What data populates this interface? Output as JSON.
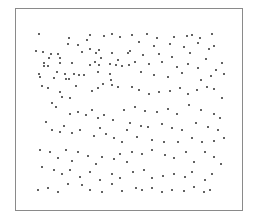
{
  "chart_data": {
    "type": "scatter",
    "title": "",
    "title_visible_fragment": "clipped title text (unreadable, only bottom pixels visible)",
    "xlabel": "",
    "ylabel": "",
    "grid": false,
    "legend": null,
    "axes_ticks_visible": false,
    "frame": {
      "left": 15,
      "top": 8,
      "right": 243,
      "bottom": 211,
      "color": "#8a8a8a"
    },
    "point_color": "#444444",
    "points": [
      [
        37,
        32
      ],
      [
        67,
        36
      ],
      [
        85,
        38
      ],
      [
        88,
        33
      ],
      [
        102,
        34
      ],
      [
        110,
        32
      ],
      [
        118,
        35
      ],
      [
        66,
        42
      ],
      [
        76,
        43
      ],
      [
        88,
        47
      ],
      [
        34,
        49
      ],
      [
        41,
        50
      ],
      [
        49,
        52
      ],
      [
        56,
        52
      ],
      [
        80,
        50
      ],
      [
        94,
        51
      ],
      [
        97,
        48
      ],
      [
        110,
        51
      ],
      [
        126,
        51
      ],
      [
        47,
        56
      ],
      [
        58,
        56
      ],
      [
        99,
        56
      ],
      [
        116,
        58
      ],
      [
        42,
        61
      ],
      [
        58,
        61
      ],
      [
        70,
        61
      ],
      [
        88,
        63
      ],
      [
        93,
        60
      ],
      [
        97,
        63
      ],
      [
        108,
        62
      ],
      [
        114,
        63
      ],
      [
        120,
        64
      ],
      [
        127,
        63
      ],
      [
        42,
        64
      ],
      [
        46,
        64
      ],
      [
        37,
        72
      ],
      [
        55,
        70
      ],
      [
        63,
        72
      ],
      [
        72,
        72
      ],
      [
        77,
        73
      ],
      [
        82,
        73
      ],
      [
        96,
        70
      ],
      [
        108,
        72
      ],
      [
        38,
        75
      ],
      [
        52,
        76
      ],
      [
        64,
        77
      ],
      [
        67,
        77
      ],
      [
        109,
        78
      ],
      [
        130,
        33
      ],
      [
        145,
        32
      ],
      [
        155,
        36
      ],
      [
        172,
        35
      ],
      [
        185,
        34
      ],
      [
        190,
        33
      ],
      [
        198,
        36
      ],
      [
        210,
        32
      ],
      [
        137,
        40
      ],
      [
        152,
        44
      ],
      [
        168,
        42
      ],
      [
        182,
        45
      ],
      [
        196,
        41
      ],
      [
        207,
        47
      ],
      [
        212,
        44
      ],
      [
        128,
        49
      ],
      [
        141,
        53
      ],
      [
        157,
        52
      ],
      [
        170,
        55
      ],
      [
        188,
        51
      ],
      [
        204,
        57
      ],
      [
        133,
        60
      ],
      [
        147,
        62
      ],
      [
        160,
        60
      ],
      [
        175,
        65
      ],
      [
        186,
        62
      ],
      [
        196,
        66
      ],
      [
        214,
        68
      ],
      [
        220,
        61
      ],
      [
        139,
        70
      ],
      [
        152,
        73
      ],
      [
        166,
        75
      ],
      [
        180,
        71
      ],
      [
        199,
        78
      ],
      [
        209,
        74
      ],
      [
        222,
        72
      ],
      [
        40,
        84
      ],
      [
        46,
        86
      ],
      [
        58,
        90
      ],
      [
        60,
        95
      ],
      [
        68,
        96
      ],
      [
        74,
        84
      ],
      [
        90,
        89
      ],
      [
        96,
        86
      ],
      [
        101,
        82
      ],
      [
        110,
        83
      ],
      [
        116,
        85
      ],
      [
        50,
        101
      ],
      [
        54,
        105
      ],
      [
        68,
        112
      ],
      [
        76,
        110
      ],
      [
        84,
        113
      ],
      [
        90,
        108
      ],
      [
        96,
        116
      ],
      [
        102,
        113
      ],
      [
        111,
        118
      ],
      [
        122,
        108
      ],
      [
        44,
        120
      ],
      [
        50,
        128
      ],
      [
        58,
        130
      ],
      [
        62,
        124
      ],
      [
        70,
        131
      ],
      [
        78,
        128
      ],
      [
        92,
        134
      ],
      [
        98,
        126
      ],
      [
        104,
        132
      ],
      [
        112,
        136
      ],
      [
        120,
        140
      ],
      [
        125,
        128
      ],
      [
        130,
        85
      ],
      [
        137,
        88
      ],
      [
        147,
        92
      ],
      [
        157,
        90
      ],
      [
        168,
        89
      ],
      [
        178,
        86
      ],
      [
        186,
        92
      ],
      [
        195,
        88
      ],
      [
        205,
        85
      ],
      [
        212,
        87
      ],
      [
        220,
        96
      ],
      [
        133,
        105
      ],
      [
        143,
        109
      ],
      [
        155,
        110
      ],
      [
        166,
        107
      ],
      [
        175,
        112
      ],
      [
        187,
        103
      ],
      [
        199,
        108
      ],
      [
        212,
        112
      ],
      [
        218,
        116
      ],
      [
        128,
        121
      ],
      [
        139,
        124
      ],
      [
        146,
        125
      ],
      [
        160,
        122
      ],
      [
        170,
        126
      ],
      [
        180,
        128
      ],
      [
        194,
        121
      ],
      [
        206,
        125
      ],
      [
        216,
        128
      ],
      [
        135,
        135
      ],
      [
        150,
        138
      ],
      [
        162,
        140
      ],
      [
        176,
        140
      ],
      [
        190,
        136
      ],
      [
        200,
        140
      ],
      [
        212,
        139
      ],
      [
        222,
        136
      ],
      [
        38,
        148
      ],
      [
        48,
        150
      ],
      [
        56,
        156
      ],
      [
        64,
        148
      ],
      [
        70,
        159
      ],
      [
        76,
        150
      ],
      [
        86,
        154
      ],
      [
        94,
        162
      ],
      [
        100,
        155
      ],
      [
        112,
        157
      ],
      [
        118,
        152
      ],
      [
        125,
        160
      ],
      [
        40,
        165
      ],
      [
        52,
        168
      ],
      [
        60,
        172
      ],
      [
        68,
        168
      ],
      [
        78,
        175
      ],
      [
        88,
        170
      ],
      [
        98,
        178
      ],
      [
        110,
        172
      ],
      [
        118,
        176
      ],
      [
        36,
        188
      ],
      [
        46,
        186
      ],
      [
        56,
        190
      ],
      [
        66,
        182
      ],
      [
        80,
        183
      ],
      [
        88,
        188
      ],
      [
        100,
        190
      ],
      [
        110,
        182
      ],
      [
        120,
        189
      ],
      [
        130,
        150
      ],
      [
        140,
        152
      ],
      [
        150,
        148
      ],
      [
        163,
        153
      ],
      [
        172,
        156
      ],
      [
        184,
        150
      ],
      [
        192,
        160
      ],
      [
        203,
        150
      ],
      [
        212,
        155
      ],
      [
        219,
        162
      ],
      [
        131,
        170
      ],
      [
        142,
        168
      ],
      [
        150,
        176
      ],
      [
        161,
        174
      ],
      [
        172,
        172
      ],
      [
        183,
        175
      ],
      [
        190,
        170
      ],
      [
        203,
        178
      ],
      [
        210,
        172
      ],
      [
        134,
        186
      ],
      [
        140,
        188
      ],
      [
        150,
        186
      ],
      [
        160,
        190
      ],
      [
        170,
        188
      ],
      [
        182,
        189
      ],
      [
        192,
        185
      ],
      [
        202,
        190
      ],
      [
        208,
        188
      ]
    ]
  }
}
